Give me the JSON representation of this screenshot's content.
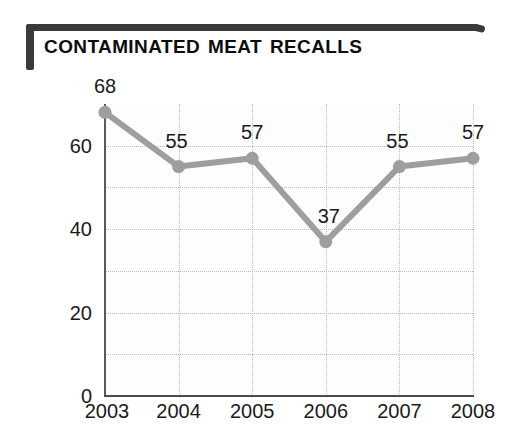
{
  "title": "Contaminated Meat Recalls",
  "chart_data": {
    "type": "line",
    "title": "Contaminated Meat Recalls",
    "xlabel": "",
    "ylabel": "",
    "categories": [
      "2003",
      "2004",
      "2005",
      "2006",
      "2007",
      "2008"
    ],
    "values": [
      68,
      55,
      57,
      37,
      55,
      57
    ],
    "point_labels": [
      "68",
      "55",
      "57",
      "37",
      "55",
      "57"
    ],
    "ylim": [
      0,
      70
    ],
    "ytick_labels": [
      "0",
      "20",
      "40",
      "60"
    ],
    "ytick_values": [
      0,
      20,
      40,
      60
    ],
    "gridline_values": [
      10,
      20,
      30,
      40,
      50,
      60
    ],
    "grid": "dotted horizontal and vertical",
    "legend": "none",
    "series_color": "#9e9e9e",
    "marker": "circle",
    "marker_color": "#9e9e9e"
  },
  "colors": {
    "accent": "#9e9e9e",
    "title_text": "#0d0d0d",
    "axis": "#4a4a4a",
    "grid": "#b9b9b9",
    "background": "#ffffff"
  }
}
